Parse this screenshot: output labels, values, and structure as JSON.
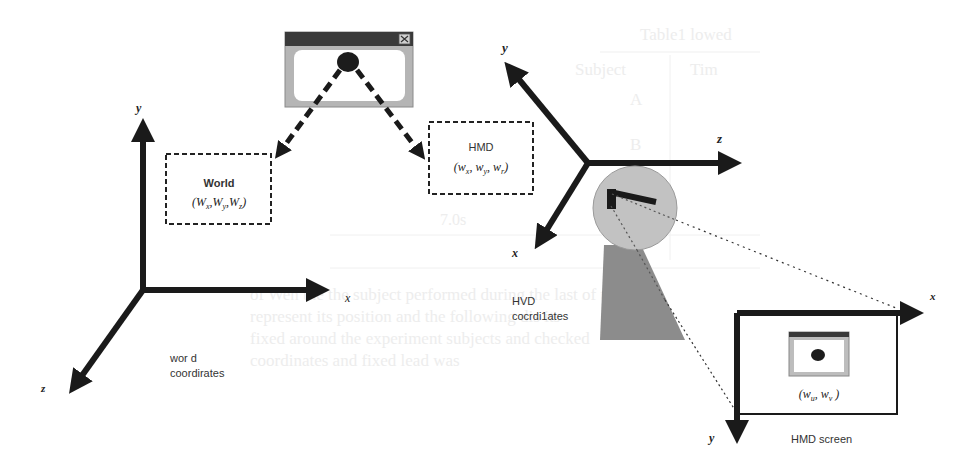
{
  "diagram": {
    "type": "coordinate-system-mapping",
    "colors": {
      "axis": "#1a1a1a",
      "window_titlebar": "#3a3a3a",
      "window_frame": "#b0b0b0",
      "head_fill": "#c0c0c0",
      "body_fill": "#8c8c8c",
      "dot": "#1c1c1c",
      "ghost_text": "#ececec"
    },
    "source_window": {
      "label": "application window",
      "close_glyph": "✕"
    },
    "world_box": {
      "title": "World",
      "coords": "(Wₓ, Wᵧ, Wₓ)",
      "coords_parts": [
        "W",
        "x",
        "W",
        "y",
        "W",
        "z"
      ]
    },
    "hmd_box": {
      "title": "HMD",
      "coords_parts": [
        "w",
        "x",
        "w",
        "y",
        "w",
        "r"
      ]
    },
    "world_axes": {
      "y_label": "y",
      "x_label": "x",
      "z_label": "z",
      "caption_line1": "wor d",
      "caption_line2": "coordirates"
    },
    "hmd_axes": {
      "y_label": "y",
      "z_label": "z",
      "x_label": "x",
      "caption_line1": "HVD",
      "caption_line2": "cocrdi1ates"
    },
    "hmd_screen": {
      "x_label": "x",
      "y_label": "y",
      "coords_parts": [
        "w",
        "u",
        "w",
        "v"
      ],
      "caption": "HMD screen"
    },
    "background_ghost": {
      "table_title": "Table1 lowed",
      "table_cell1": "Subject",
      "table_cell2": "Tim",
      "table_cell3": "A",
      "table_cell4": "B",
      "table_value": "7.0s",
      "para_line1": "of Wen the   the subject performed during the last of the i",
      "para_line2": "represent its position and the following dis   its",
      "para_line3": "fixed around the experiment subjects and checked",
      "para_line4": "coordinates and   fixed lead   was"
    }
  }
}
